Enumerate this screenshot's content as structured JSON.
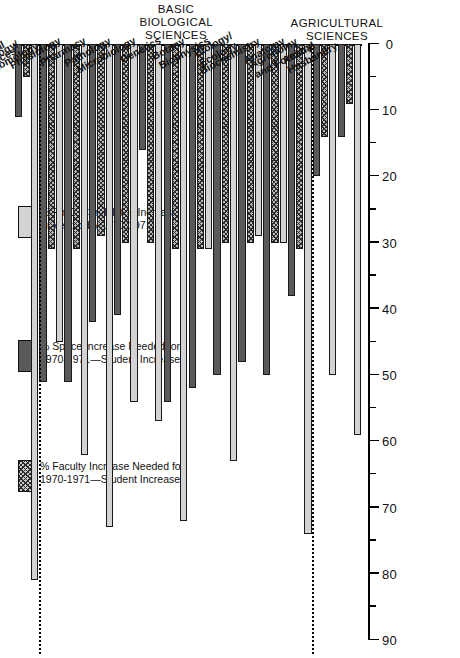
{
  "chart_data": {
    "type": "bar",
    "orientation": "horizontal",
    "title": "",
    "xlabel": "",
    "ylabel": "",
    "xlim": [
      0,
      90
    ],
    "xticks": [
      0,
      10,
      20,
      30,
      40,
      50,
      60,
      70,
      80,
      90
    ],
    "xticklabels": [
      "0",
      "10",
      "20",
      "30",
      "40",
      "50",
      "60",
      "70",
      "80",
      "90"
    ],
    "minor_ticks": [
      5,
      15,
      25,
      35,
      45,
      55,
      65,
      75,
      85
    ],
    "grid": false,
    "legend_position": "left",
    "series": [
      {
        "name": "% Ph.D. Candidates Increase Projected by 1970-1971",
        "swatch": "light",
        "color": "#d3d3d3",
        "values": [
          59,
          50,
          74,
          30,
          29,
          63,
          31,
          72,
          57,
          54,
          73,
          62,
          45,
          81
        ]
      },
      {
        "name": "% Faculty Increase Needed for 1970-1971—Student Increase",
        "swatch": "hatch",
        "color": "#b9b9b9",
        "values": [
          9,
          14,
          31,
          30,
          30,
          30,
          31,
          31,
          30,
          30,
          29,
          31,
          31,
          5
        ]
      },
      {
        "name": "% Space Increase Needed for 1970-1971—Student Increase",
        "swatch": "dark",
        "color": "#595959",
        "values": [
          14,
          20,
          38,
          50,
          48,
          50,
          52,
          54,
          16,
          41,
          42,
          51,
          51,
          11
        ]
      }
    ],
    "categories": [
      "Animal\nHusbandry",
      "Agronomy\nand Forestry",
      "Anatomy",
      "Biochemistry",
      "Biology/\nEcology",
      "Biophysics",
      "Botany",
      "Genetics",
      "Microbiology",
      "Pathology",
      "Pharmacy",
      "Physiology",
      "Zoology/\nEntomology",
      "Clinical\nMedical\nSciences"
    ],
    "sections": [
      {
        "label": "AGRICULTURAL\nSCIENCES",
        "from": 0,
        "to": 1
      },
      {
        "label": "BASIC BIOLOGICAL SCIENCES",
        "from": 2,
        "to": 12
      }
    ],
    "separators_after": [
      1,
      12
    ],
    "bars": [
      {
        "category": "Animal Husbandry",
        "phd": 59,
        "faculty": 9,
        "space": 14
      },
      {
        "category": "Agronomy and Forestry",
        "phd": 50,
        "faculty": 14,
        "space": 20
      },
      {
        "category": "Anatomy",
        "phd": 74,
        "faculty": 31,
        "space": 38
      },
      {
        "category": "Biochemistry",
        "phd": 30,
        "faculty": 30,
        "space": 50
      },
      {
        "category": "Biology/Ecology",
        "phd": 29,
        "faculty": 30,
        "space": 48
      },
      {
        "category": "Biophysics",
        "phd": 63,
        "faculty": 30,
        "space": 50
      },
      {
        "category": "Botany",
        "phd": 31,
        "faculty": 31,
        "space": 52
      },
      {
        "category": "Genetics",
        "phd": 72,
        "faculty": 31,
        "space": 54
      },
      {
        "category": "Microbiology",
        "phd": 57,
        "faculty": 30,
        "space": 16
      },
      {
        "category": "Pathology",
        "phd": 54,
        "faculty": 30,
        "space": 41
      },
      {
        "category": "Pharmacy",
        "phd": 73,
        "faculty": 29,
        "space": 42
      },
      {
        "category": "Physiology",
        "phd": 62,
        "faculty": 31,
        "space": 51
      },
      {
        "category": "Zoology/Entomology",
        "phd": 45,
        "faculty": 31,
        "space": 51
      },
      {
        "category": "Clinical Medical Sciences",
        "phd": 81,
        "faculty": 5,
        "space": 11
      }
    ]
  },
  "legend": {
    "items": [
      {
        "swatch": "light",
        "line1": "% Ph.D. Candidates Increase",
        "line2": "Projected by 1970-1971"
      },
      {
        "swatch": "hatch",
        "line1": "% Faculty Increase Needed for",
        "line2": "1970-1971—Student Increase"
      },
      {
        "swatch": "dark",
        "line1": "% Space Increase Needed for",
        "line2": "1970-1971—Student Increase"
      }
    ]
  }
}
